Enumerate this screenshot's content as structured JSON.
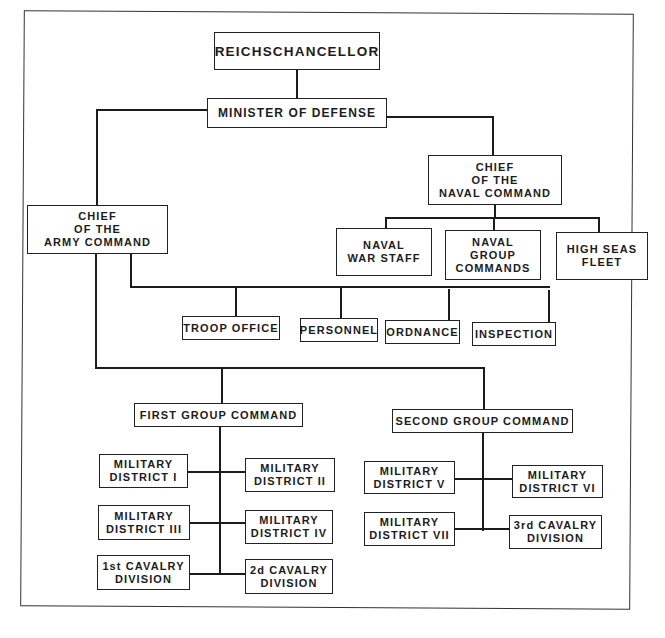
{
  "diagram": {
    "type": "organization-chart",
    "root": {
      "label": "REICHSCHANCELLOR",
      "child": {
        "label": "MINISTER OF DEFENSE",
        "naval": {
          "label": "CHIEF\nOF THE\nNAVAL COMMAND",
          "children": [
            {
              "label": "NAVAL\nWAR STAFF"
            },
            {
              "label": "NAVAL\nGROUP\nCOMMANDS"
            },
            {
              "label": "HIGH SEAS\nFLEET"
            }
          ]
        },
        "army": {
          "label": "CHIEF\nOF THE\nARMY COMMAND",
          "offices": [
            {
              "label": "TROOP OFFICE"
            },
            {
              "label": "PERSONNEL"
            },
            {
              "label": "ORDNANCE"
            },
            {
              "label": "INSPECTION"
            }
          ],
          "first_group": {
            "label": "FIRST GROUP COMMAND",
            "children": [
              {
                "label": "MILITARY\nDISTRICT I"
              },
              {
                "label": "MILITARY\nDISTRICT II"
              },
              {
                "label": "MILITARY\nDISTRICT III"
              },
              {
                "label": "MILITARY\nDISTRICT IV"
              },
              {
                "label": "1st CAVALRY\nDIVISION"
              },
              {
                "label": "2d CAVALRY\nDIVISION"
              }
            ]
          },
          "second_group": {
            "label": "SECOND GROUP COMMAND",
            "children": [
              {
                "label": "MILITARY\nDISTRICT V"
              },
              {
                "label": "MILITARY\nDISTRICT VI"
              },
              {
                "label": "MILITARY\nDISTRICT VII"
              },
              {
                "label": "3rd CAVALRY\nDIVISION"
              }
            ]
          }
        }
      }
    },
    "colors": {
      "ink": "#1c1c1c",
      "paper": "#ffffff"
    }
  }
}
